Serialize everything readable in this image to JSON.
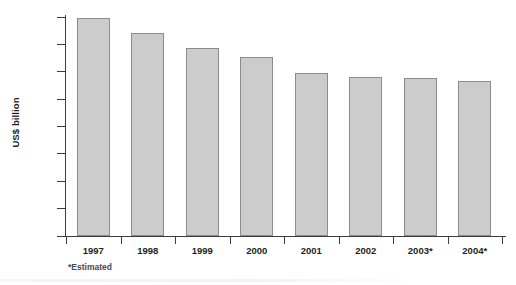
{
  "chart_data": {
    "type": "bar",
    "title": "",
    "subtitle": "",
    "xlabel": "",
    "ylabel": "US$ billion",
    "categories": [
      "1997",
      "1998",
      "1999",
      "2000",
      "2001",
      "2002",
      "2003*",
      "2004*"
    ],
    "values": [
      159,
      148,
      137,
      131,
      119,
      116,
      115.5,
      113
    ],
    "ylim": [
      0,
      160
    ],
    "ytick_labels": [
      "0",
      "20",
      "40",
      "60",
      "80",
      "100",
      "120",
      "140",
      "160"
    ],
    "ytick_values": [
      0,
      20,
      40,
      60,
      80,
      100,
      120,
      140,
      160
    ],
    "grid": false,
    "legend": null,
    "annotations": [
      "*Estimated"
    ],
    "series": [
      {
        "name": "US$ billion",
        "values": [
          159,
          148,
          137,
          131,
          119,
          116,
          115.5,
          113
        ]
      }
    ],
    "colors": {
      "bar_fill": "#cccccc",
      "bar_border": "#8c8c8c",
      "axis": "#3c3c3c",
      "text": "#231f20",
      "background": "#ffffff"
    }
  },
  "footnote": "*Estimated"
}
